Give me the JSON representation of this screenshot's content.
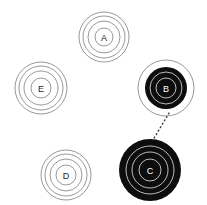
{
  "figure": {
    "background_color": "#ffffff",
    "width": 207,
    "height": 205
  },
  "style": {
    "ring_stroke_light": "#8c8c8c",
    "ring_stroke_on_dark": "#cfcfcf",
    "fill_none": "none",
    "fill_dark": "#0d0d0d",
    "label_light": "#1a1a1a",
    "label_dark": "#ffffff",
    "edge_color": "#3a3a3a"
  },
  "nodes": [
    {
      "id": "A",
      "label": "A",
      "cx": 104,
      "cy": 37,
      "filled": false,
      "ring_radii": [
        25,
        21,
        16,
        9
      ],
      "label_color": "#1a1a1a",
      "ring_color": "#8c8c8c"
    },
    {
      "id": "E",
      "label": "E",
      "cx": 41,
      "cy": 88,
      "filled": false,
      "ring_radii": [
        26,
        22,
        17,
        10
      ],
      "label_color": "#1a1a1a",
      "ring_color": "#8c8c8c"
    },
    {
      "id": "B",
      "label": "B",
      "cx": 166,
      "cy": 88,
      "filled": true,
      "disc_radius": 21,
      "outer_ring_radius": 28,
      "ring_radii": [
        16,
        10
      ],
      "label_color": "#ffffff",
      "ring_color": "#cfcfcf"
    },
    {
      "id": "D",
      "label": "D",
      "cx": 66,
      "cy": 175,
      "filled": false,
      "ring_radii": [
        25,
        21,
        16,
        10
      ],
      "label_color": "#1a1a1a",
      "ring_color": "#8c8c8c"
    },
    {
      "id": "C",
      "label": "C",
      "cx": 150,
      "cy": 170,
      "filled": true,
      "disc_radius": 31,
      "outer_ring_radius": 31,
      "ring_radii": [
        24,
        18,
        11
      ],
      "label_color": "#ffffff",
      "ring_color": "#cfcfcf"
    }
  ],
  "edges": [
    {
      "id": "B-C",
      "from": "B",
      "to": "C",
      "x1": 169,
      "y1": 113,
      "x2": 153,
      "y2": 140,
      "style": "dotted",
      "color": "#3a3a3a",
      "width": 1.4,
      "dash": "1 3"
    }
  ]
}
